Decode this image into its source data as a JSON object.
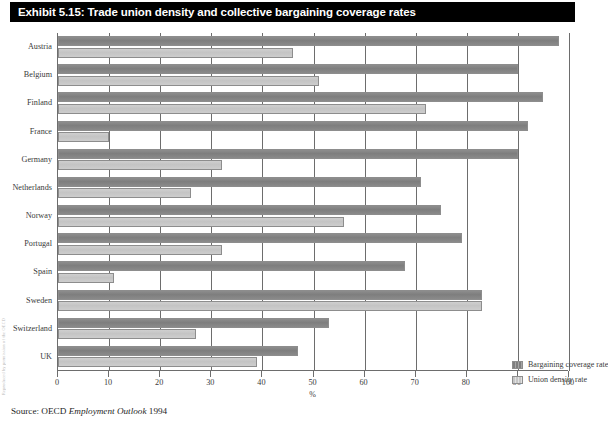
{
  "title": "Exhibit 5.15: Trade union density and collective bargaining coverage rates",
  "watermark": "Reproduced by permission of the OECD",
  "source": {
    "prefix": "Source: OECD ",
    "italic": "Employment Outlook",
    "suffix": " 1994"
  },
  "legend": {
    "position": "inside-bottom-right",
    "items": [
      {
        "label": "Bargaining coverage rate",
        "color": "#7e7e7e",
        "key": "coverage"
      },
      {
        "label": "Union density rate",
        "color": "#c6c6c6",
        "key": "density"
      }
    ]
  },
  "chart_data": {
    "type": "bar",
    "orientation": "horizontal",
    "title": "Exhibit 5.15: Trade union density and collective bargaining coverage rates",
    "xlabel": "%",
    "ylabel": "",
    "xlim": [
      0,
      100
    ],
    "xticks": [
      0,
      10,
      20,
      30,
      40,
      50,
      60,
      70,
      80,
      90,
      100
    ],
    "xtick_labels": [
      "0",
      "10",
      "20",
      "30",
      "40",
      "50",
      "60",
      "70",
      "80",
      "90",
      "100"
    ],
    "grid": true,
    "grid_axis": "x",
    "categories": [
      "Austria",
      "Belgium",
      "Finland",
      "France",
      "Germany",
      "Netherlands",
      "Norway",
      "Portugal",
      "Spain",
      "Sweden",
      "Switzerland",
      "UK"
    ],
    "series": [
      {
        "name": "Bargaining coverage rate",
        "color": "#7e7e7e",
        "values": [
          98,
          90,
          95,
          92,
          90,
          71,
          75,
          79,
          68,
          83,
          53,
          47
        ]
      },
      {
        "name": "Union density rate",
        "color": "#c6c6c6",
        "values": [
          46,
          51,
          72,
          10,
          32,
          26,
          56,
          32,
          11,
          83,
          27,
          39
        ]
      }
    ]
  }
}
